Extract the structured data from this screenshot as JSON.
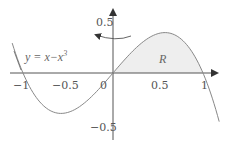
{
  "chart_data": {
    "type": "line",
    "title": "",
    "equation_label": "y = x−x³",
    "region_label": "R",
    "function": "y = x - x^3",
    "xlim": [
      -1.1,
      1.15
    ],
    "ylim": [
      -0.6,
      0.6
    ],
    "x_ticks": [
      {
        "value": -1,
        "label": "−1"
      },
      {
        "value": -0.5,
        "label": "−0.5"
      },
      {
        "value": 0,
        "label": "0"
      },
      {
        "value": 0.5,
        "label": "0.5"
      },
      {
        "value": 1,
        "label": "1"
      }
    ],
    "y_ticks": [
      {
        "value": 0.5,
        "label": "0.5"
      },
      {
        "value": -0.5,
        "label": "−0.5"
      }
    ],
    "shaded_region": {
      "from": 0,
      "to": 1,
      "description": "area between curve and x-axis for 0 ≤ x ≤ 1"
    },
    "rotation_arrow": {
      "about": "y-axis",
      "direction": "counterclockwise"
    },
    "grid": false,
    "colors": {
      "curve": "#888888",
      "axes": "#555555",
      "shade": "#eeeeee",
      "text": "#555555"
    }
  },
  "labels": {
    "equation": "y = x−x³",
    "equation_main": "y = x−x",
    "equation_exp": "3",
    "region": "R",
    "x_tick_neg1": "−1",
    "x_tick_neg05": "−0.5",
    "x_tick_0": "0",
    "x_tick_05": "0.5",
    "x_tick_1": "1",
    "y_tick_05": "0.5",
    "y_tick_neg05": "−0.5"
  },
  "layout": {
    "origin": [
      113,
      73
    ],
    "x_scale": 90,
    "y_scale": 105
  }
}
